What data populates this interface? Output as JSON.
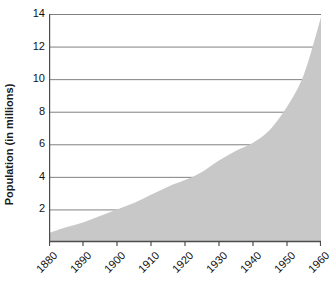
{
  "chart_data": {
    "type": "area",
    "title": "",
    "xlabel": "",
    "ylabel": "Population (in millions)",
    "xlim": [
      1880,
      1960
    ],
    "ylim": [
      0,
      14
    ],
    "grid": true,
    "legend": "none",
    "series_color": "#c8c8c8",
    "axis_color": "#4d4d4d",
    "grid_color": "#808080",
    "background_color": "#ffffff",
    "x_tick_labels": [
      "1880",
      "1890",
      "1900",
      "1910",
      "1920",
      "1930",
      "1940",
      "1950",
      "1960"
    ],
    "x_ticks": [
      1880,
      1890,
      1900,
      1910,
      1920,
      1930,
      1940,
      1950,
      1960
    ],
    "y_tick_labels": [
      "2",
      "4",
      "6",
      "8",
      "10",
      "12",
      "14"
    ],
    "y_ticks": [
      2,
      4,
      6,
      8,
      10,
      12,
      14
    ],
    "x": [
      1880,
      1885,
      1890,
      1895,
      1900,
      1905,
      1910,
      1915,
      1920,
      1925,
      1930,
      1935,
      1940,
      1945,
      1950,
      1955,
      1960
    ],
    "values": [
      0.55,
      0.9,
      1.2,
      1.6,
      2.0,
      2.4,
      2.9,
      3.4,
      3.8,
      4.3,
      5.0,
      5.6,
      6.1,
      6.9,
      8.3,
      10.3,
      13.8
    ],
    "series": [
      {
        "name": "Population",
        "values": [
          0.55,
          0.9,
          1.2,
          1.6,
          2.0,
          2.4,
          2.9,
          3.4,
          3.8,
          4.3,
          5.0,
          5.6,
          6.1,
          6.9,
          8.3,
          10.3,
          13.8
        ]
      }
    ]
  }
}
